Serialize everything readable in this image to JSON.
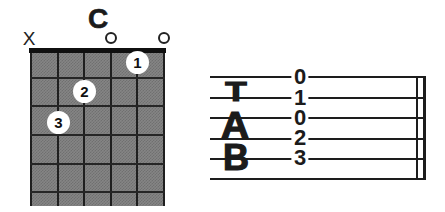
{
  "figure": {
    "type": "guitar-chord-diagram-with-tablature",
    "chord_name": "C"
  },
  "chord": {
    "title": "C",
    "muted_marker": "X",
    "strings": 6,
    "frets_shown": 5,
    "marker_layout": [
      {
        "string": 1,
        "type": "muted"
      },
      {
        "string": 4,
        "type": "open"
      },
      {
        "string": 6,
        "type": "open"
      }
    ],
    "fingers": [
      {
        "label": "1",
        "string": 5,
        "fret": 1
      },
      {
        "label": "2",
        "string": 3,
        "fret": 2
      },
      {
        "label": "3",
        "string": 2,
        "fret": 3
      }
    ]
  },
  "tab": {
    "clef": [
      "T",
      "A",
      "B"
    ],
    "lines": 6,
    "notes": [
      {
        "line": 1,
        "fret": "0"
      },
      {
        "line": 2,
        "fret": "1"
      },
      {
        "line": 3,
        "fret": "0"
      },
      {
        "line": 4,
        "fret": "2"
      },
      {
        "line": 5,
        "fret": "3"
      }
    ],
    "end_barline": "double"
  },
  "colors": {
    "ink": "#1b1b1b",
    "paper": "#ffffff",
    "grid_fill": "#858585"
  }
}
